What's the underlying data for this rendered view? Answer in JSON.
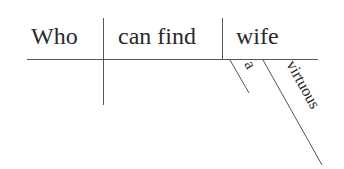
{
  "diagram": {
    "type": "sentence-diagram",
    "subject": "Who",
    "verb": "can find",
    "object": "wife",
    "modifiers": [
      {
        "word": "a",
        "modifies": "wife"
      },
      {
        "word": "virtuous",
        "modifies": "wife"
      }
    ],
    "colors": {
      "text": "#2a2a2a",
      "line": "#555555",
      "background": "#ffffff"
    }
  }
}
